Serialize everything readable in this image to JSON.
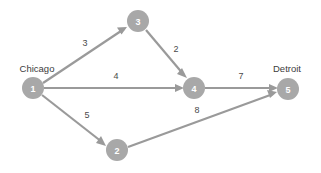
{
  "diagram": {
    "background_color": "#ffffff",
    "node_fill_color": "#a8a8a8",
    "node_text_color": "#ffffff",
    "edge_color": "#9a9a9a",
    "label_color": "#3c3c3c",
    "weight_color": "#4a4a4a",
    "nodes": [
      {
        "id": "1",
        "label": "1",
        "city": "Chicago",
        "cx": 33,
        "cy": 88,
        "r": 11,
        "city_x": 37,
        "city_y": 72
      },
      {
        "id": "2",
        "label": "2",
        "city": "",
        "cx": 117,
        "cy": 150,
        "r": 11,
        "city_x": 0,
        "city_y": 0
      },
      {
        "id": "3",
        "label": "3",
        "city": "",
        "cx": 138,
        "cy": 21,
        "r": 11,
        "city_x": 0,
        "city_y": 0
      },
      {
        "id": "4",
        "label": "4",
        "city": "",
        "cx": 194,
        "cy": 88,
        "r": 11,
        "city_x": 0,
        "city_y": 0
      },
      {
        "id": "5",
        "label": "5",
        "city": "Detroit",
        "cx": 288,
        "cy": 89,
        "r": 11,
        "city_x": 287,
        "city_y": 72
      }
    ],
    "edges": [
      {
        "from": "1",
        "to": "3",
        "weight": "3",
        "x1": 43,
        "y1": 83,
        "x2": 127,
        "y2": 27,
        "label_x": 85,
        "label_y": 46
      },
      {
        "from": "3",
        "to": "4",
        "weight": "2",
        "x1": 146,
        "y1": 30,
        "x2": 187,
        "y2": 78,
        "label_x": 176,
        "label_y": 52
      },
      {
        "from": "1",
        "to": "4",
        "weight": "4",
        "x1": 44,
        "y1": 88,
        "x2": 182,
        "y2": 88,
        "label_x": 116,
        "label_y": 79
      },
      {
        "from": "1",
        "to": "2",
        "weight": "5",
        "x1": 42,
        "y1": 95,
        "x2": 105,
        "y2": 145,
        "label_x": 87,
        "label_y": 118
      },
      {
        "from": "2",
        "to": "5",
        "weight": "8",
        "x1": 128,
        "y1": 147,
        "x2": 277,
        "y2": 93,
        "label_x": 197,
        "label_y": 113
      },
      {
        "from": "4",
        "to": "5",
        "weight": "7",
        "x1": 205,
        "y1": 88,
        "x2": 276,
        "y2": 88,
        "label_x": 241,
        "label_y": 79
      }
    ]
  }
}
